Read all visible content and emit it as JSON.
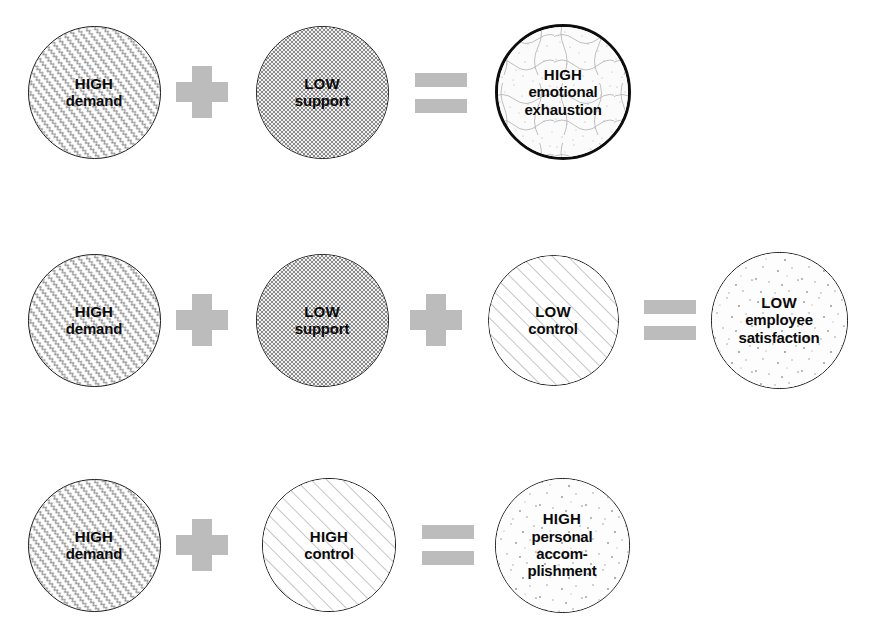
{
  "figure": {
    "background_color": "#ffffff",
    "operator_color": "#bcbcbc",
    "outline_color": "#1a1a1a",
    "text_color": "#0a0a0a"
  },
  "rows": [
    {
      "id": "row-emotional-exhaustion",
      "items": [
        {
          "kind": "node",
          "name": "high-demand",
          "lines": [
            "HIGH",
            "demand"
          ],
          "pattern": "zigzag-diagonal",
          "outline": "thin",
          "cx": 94,
          "cy": 92,
          "d": 133,
          "font_size": 15
        },
        {
          "kind": "operator",
          "name": "plus-operator",
          "glyph": "plus",
          "symbol": "+",
          "cx": 202,
          "cy": 92
        },
        {
          "kind": "node",
          "name": "low-support",
          "lines": [
            "LOW",
            "support"
          ],
          "pattern": "checker-dense",
          "outline": "thin",
          "cx": 322,
          "cy": 92,
          "d": 133,
          "font_size": 15
        },
        {
          "kind": "operator",
          "name": "equals-operator",
          "glyph": "equals",
          "symbol": "=",
          "cx": 441,
          "cy": 93
        },
        {
          "kind": "node",
          "name": "high-emotional-exhaustion",
          "lines": [
            "HIGH",
            "emotional",
            "exhaustion"
          ],
          "pattern": "stipple-crackle",
          "outline": "thick",
          "cx": 563,
          "cy": 92,
          "d": 136,
          "font_size": 15
        }
      ]
    },
    {
      "id": "row-employee-satisfaction",
      "items": [
        {
          "kind": "node",
          "name": "high-demand",
          "lines": [
            "HIGH",
            "demand"
          ],
          "pattern": "zigzag-diagonal",
          "outline": "thin",
          "cx": 94,
          "cy": 320,
          "d": 133,
          "font_size": 15
        },
        {
          "kind": "operator",
          "name": "plus-operator",
          "glyph": "plus",
          "symbol": "+",
          "cx": 202,
          "cy": 320
        },
        {
          "kind": "node",
          "name": "low-support",
          "lines": [
            "LOW",
            "support"
          ],
          "pattern": "checker-dense",
          "outline": "thin",
          "cx": 322,
          "cy": 320,
          "d": 133,
          "font_size": 15
        },
        {
          "kind": "operator",
          "name": "plus-operator",
          "glyph": "plus",
          "symbol": "+",
          "cx": 436,
          "cy": 320
        },
        {
          "kind": "node",
          "name": "low-control",
          "lines": [
            "LOW",
            "control"
          ],
          "pattern": "diagonal-hatch",
          "outline": "thin",
          "cx": 553,
          "cy": 320,
          "d": 131,
          "font_size": 15
        },
        {
          "kind": "operator",
          "name": "equals-operator",
          "glyph": "equals",
          "symbol": "=",
          "cx": 670,
          "cy": 320
        },
        {
          "kind": "node",
          "name": "low-employee-satisfaction",
          "lines": [
            "LOW",
            "employee",
            "satisfaction"
          ],
          "pattern": "sparse-speckle",
          "outline": "thin",
          "cx": 779,
          "cy": 320,
          "d": 137,
          "font_size": 15
        }
      ]
    },
    {
      "id": "row-personal-accomplishment",
      "items": [
        {
          "kind": "node",
          "name": "high-demand",
          "lines": [
            "HIGH",
            "demand"
          ],
          "pattern": "zigzag-diagonal",
          "outline": "thin",
          "cx": 94,
          "cy": 545,
          "d": 133,
          "font_size": 15
        },
        {
          "kind": "operator",
          "name": "plus-operator",
          "glyph": "plus",
          "symbol": "+",
          "cx": 202,
          "cy": 545
        },
        {
          "kind": "node",
          "name": "high-control",
          "lines": [
            "HIGH",
            "control"
          ],
          "pattern": "diagonal-hatch",
          "outline": "thin",
          "cx": 329,
          "cy": 545,
          "d": 134,
          "font_size": 15
        },
        {
          "kind": "operator",
          "name": "equals-operator",
          "glyph": "equals",
          "symbol": "=",
          "cx": 448,
          "cy": 545
        },
        {
          "kind": "node",
          "name": "high-personal-accomplishment",
          "lines": [
            "HIGH",
            "personal",
            "accom-",
            "plishment"
          ],
          "pattern": "sparse-speckle",
          "outline": "thin",
          "cx": 562,
          "cy": 545,
          "d": 135,
          "font_size": 15
        }
      ]
    }
  ]
}
